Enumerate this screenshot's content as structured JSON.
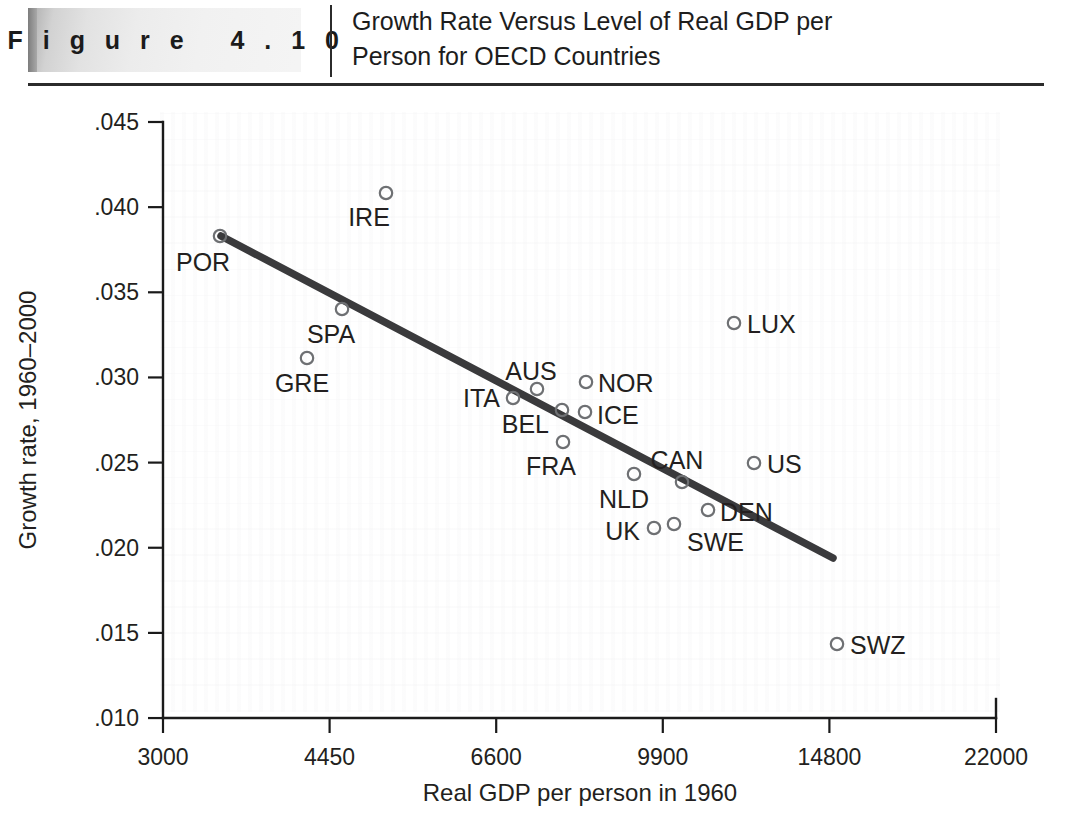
{
  "header": {
    "figure_label": "F i g u r e   4 . 1 0",
    "title_line1": "Growth Rate Versus Level of Real GDP per",
    "title_line2": "Person for OECD Countries"
  },
  "chart_data": {
    "type": "scatter",
    "title": "Growth Rate Versus Level of Real GDP per Person for OECD Countries",
    "xlabel": "Real GDP per person in 1960",
    "ylabel": "Growth rate, 1960–2000",
    "xscale": "log",
    "xlim": [
      3000,
      22000
    ],
    "ylim": [
      0.01,
      0.045
    ],
    "grid": false,
    "legend": null,
    "xticks": [
      "3000",
      "4450",
      "6600",
      "9900",
      "14800",
      "22000"
    ],
    "xtick_values": [
      3000,
      4450,
      6600,
      9900,
      14800,
      22000
    ],
    "yticks": [
      ".045",
      ".040",
      ".035",
      ".030",
      ".025",
      ".020",
      ".015",
      ".010"
    ],
    "ytick_values": [
      0.045,
      0.04,
      0.035,
      0.03,
      0.025,
      0.02,
      0.015,
      0.01
    ],
    "points": [
      {
        "label": "POR",
        "x": 3700,
        "y": 0.0386,
        "px": 220,
        "py": 236,
        "lx": 176,
        "ly": 271,
        "anchor": "start"
      },
      {
        "label": "IRE",
        "x": 5060,
        "y": 0.0409,
        "px": 386,
        "py": 193,
        "lx": 369,
        "ly": 226,
        "anchor": "middle"
      },
      {
        "label": "SPA",
        "x": 4600,
        "y": 0.0342,
        "px": 342,
        "py": 309,
        "lx": 331,
        "ly": 343,
        "anchor": "middle"
      },
      {
        "label": "GRE",
        "x": 4280,
        "y": 0.0313,
        "px": 307,
        "py": 358,
        "lx": 302,
        "ly": 392,
        "anchor": "middle"
      },
      {
        "label": "ITA",
        "x": 6800,
        "y": 0.0288,
        "px": 513,
        "py": 398,
        "lx": 500,
        "ly": 407,
        "anchor": "end"
      },
      {
        "label": "AUS",
        "x": 7100,
        "y": 0.0293,
        "px": 537,
        "py": 389,
        "lx": 531,
        "ly": 380,
        "anchor": "middle"
      },
      {
        "label": "BEL",
        "x": 7420,
        "y": 0.0281,
        "px": 562,
        "py": 410,
        "lx": 549,
        "ly": 433,
        "anchor": "end"
      },
      {
        "label": "ICE",
        "x": 7700,
        "y": 0.0279,
        "px": 585,
        "py": 412,
        "lx": 597,
        "ly": 424,
        "anchor": "start"
      },
      {
        "label": "NOR",
        "x": 7720,
        "y": 0.0299,
        "px": 586,
        "py": 382,
        "lx": 598,
        "ly": 392,
        "anchor": "start"
      },
      {
        "label": "FRA",
        "x": 7440,
        "y": 0.0262,
        "px": 563,
        "py": 442,
        "lx": 551,
        "ly": 475,
        "anchor": "middle"
      },
      {
        "label": "NLD",
        "x": 9320,
        "y": 0.0243,
        "px": 634,
        "py": 474,
        "lx": 624,
        "ly": 508,
        "anchor": "middle"
      },
      {
        "label": "CAN",
        "x": 10430,
        "y": 0.0239,
        "px": 682,
        "py": 482,
        "lx": 677,
        "ly": 469,
        "anchor": "middle"
      },
      {
        "label": "UK",
        "x": 9730,
        "y": 0.0209,
        "px": 654,
        "py": 528,
        "lx": 640,
        "ly": 540,
        "anchor": "end"
      },
      {
        "label": "SWE",
        "x": 10180,
        "y": 0.0212,
        "px": 674,
        "py": 524,
        "lx": 687,
        "ly": 551,
        "anchor": "start"
      },
      {
        "label": "DEN",
        "x": 11060,
        "y": 0.0222,
        "px": 708,
        "py": 510,
        "lx": 720,
        "ly": 521,
        "anchor": "start"
      },
      {
        "label": "US",
        "x": 12480,
        "y": 0.0251,
        "px": 754,
        "py": 463,
        "lx": 767,
        "ly": 473,
        "anchor": "start"
      },
      {
        "label": "LUX",
        "x": 11820,
        "y": 0.0334,
        "px": 734,
        "py": 323,
        "lx": 747,
        "ly": 333,
        "anchor": "start"
      },
      {
        "label": "SWZ",
        "x": 14870,
        "y": 0.0141,
        "px": 837,
        "py": 644,
        "lx": 850,
        "ly": 654,
        "anchor": "start"
      }
    ],
    "trend_line": {
      "x1": 221,
      "y1": 236,
      "x2": 833,
      "y2": 558,
      "x_start": 3700,
      "y_start": 0.0386,
      "x_end": 14900,
      "y_end": 0.0197
    }
  }
}
